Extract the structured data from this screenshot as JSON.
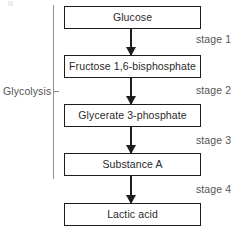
{
  "diagram": {
    "group_label": "Glycolysis",
    "nodes": [
      {
        "id": "glucose",
        "label": "Glucose"
      },
      {
        "id": "fructose-1-6-bisphosphate",
        "label": "Fructose 1,6-bisphosphate"
      },
      {
        "id": "glycerate-3-phosphate",
        "label": "Glycerate 3-phosphate"
      },
      {
        "id": "substance-a",
        "label": "Substance A"
      },
      {
        "id": "lactic-acid",
        "label": "Lactic acid"
      }
    ],
    "stages": [
      {
        "id": "stage-1",
        "label": "stage 1"
      },
      {
        "id": "stage-2",
        "label": "stage 2"
      },
      {
        "id": "stage-3",
        "label": "stage 3"
      },
      {
        "id": "stage-4",
        "label": "stage 4"
      }
    ],
    "colors": {
      "box_border": "#1d1d1d",
      "box_fill": "#ffffff",
      "arrow": "#1d1d1d",
      "text": "#2a2a2a",
      "secondary_text": "#555555",
      "bracket": "#8d8d8d",
      "background": "#ffffff"
    }
  }
}
